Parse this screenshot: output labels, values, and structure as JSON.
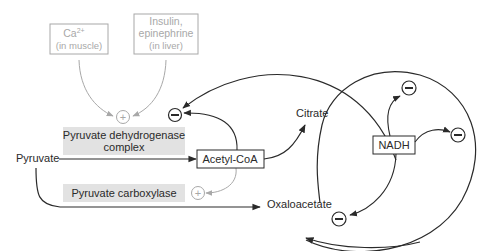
{
  "diagram": {
    "regulators": {
      "calcium": {
        "label": "Ca",
        "superscript": "2+",
        "sub": "(in muscle)"
      },
      "hormones": {
        "line1": "Insulin,",
        "line2": "epinephrine",
        "sub": "(in liver)"
      }
    },
    "enzymes": {
      "pdh": {
        "line1": "Pyruvate dehydrogenase",
        "line2": "complex"
      },
      "pc": {
        "label": "Pyruvate carboxylase"
      }
    },
    "metabolites": {
      "pyruvate": "Pyruvate",
      "acetyl_coa": "Acetyl-CoA",
      "citrate": "Citrate",
      "oxaloacetate": "Oxaloacetate",
      "nadh": "NADH"
    },
    "symbols": {
      "activation": "+",
      "inhibition": "−"
    },
    "colors": {
      "ink": "#2a2a2a",
      "regulator_gray": "#a8a8a8",
      "enzyme_fill": "#e2e2e2"
    }
  }
}
